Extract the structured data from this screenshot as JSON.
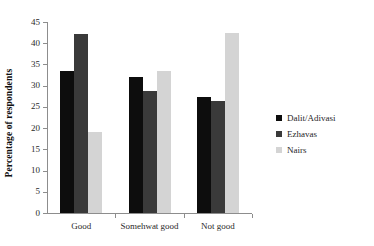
{
  "chart_data": {
    "type": "bar",
    "title": "",
    "subtitle": "",
    "xlabel": "",
    "ylabel": "Percentage of respondents",
    "categories": [
      "Good",
      "Somehwat good",
      "Not good"
    ],
    "series": [
      {
        "name": "Dalit/Adivasi",
        "color": "#0d0d0d",
        "values": [
          33.5,
          32.0,
          27.3
        ]
      },
      {
        "name": "Ezhavas",
        "color": "#3a3a3a",
        "values": [
          42.2,
          28.7,
          26.3
        ]
      },
      {
        "name": "Nairs",
        "color": "#d4d4d4",
        "values": [
          19.2,
          33.4,
          42.5
        ]
      }
    ],
    "ylim": [
      0,
      45
    ],
    "ytick_step": 5,
    "yticks": [
      0,
      5,
      10,
      15,
      20,
      25,
      30,
      35,
      40,
      45
    ],
    "ytick_labels": [
      "0",
      "5",
      "10",
      "15",
      "20",
      "25",
      "30",
      "35",
      "40",
      "45"
    ],
    "grid": false,
    "legend_position": "right",
    "orientation": "vertical",
    "grouping": "clustered"
  },
  "legend": {
    "items": [
      {
        "label": "Dalit/Adivasi",
        "color": "#0d0d0d"
      },
      {
        "label": "Ezhavas",
        "color": "#3a3a3a"
      },
      {
        "label": "Nairs",
        "color": "#d4d4d4"
      }
    ]
  },
  "axes": {
    "y_title": "Percentage of respondents",
    "axis_color": "#8d8d8d"
  }
}
